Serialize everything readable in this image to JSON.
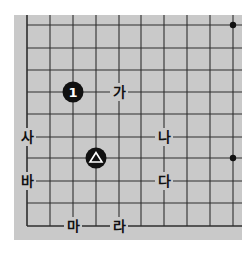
{
  "diagram": {
    "type": "go-board-fragment",
    "colors": {
      "page_bg": "#ffffff",
      "board_bg": "#c9c9c9",
      "line": "#2e2e2e",
      "stone_black": "#111111",
      "stone_mark": "#ffffff",
      "label_text": "#111111"
    },
    "board": {
      "x": 14,
      "y": 15,
      "width": 228,
      "height": 225
    },
    "grid": {
      "x_lines": [
        27,
        50,
        73,
        96,
        119,
        141,
        164,
        187,
        210,
        233
      ],
      "y_lines": [
        25,
        48,
        70,
        92,
        114,
        137,
        158,
        181,
        203,
        226
      ],
      "left_edge_drawn_from_row": 0,
      "bottom_edge_drawn": true
    },
    "star_points": [
      {
        "col": 9,
        "row": 0
      },
      {
        "col": 9,
        "row": 6
      }
    ],
    "stones": [
      {
        "id": "stone-1",
        "color": "black",
        "col": 2,
        "row": 3,
        "label": "1"
      },
      {
        "id": "stone-triangle",
        "color": "black",
        "col": 3,
        "row": 6,
        "mark": "triangle"
      }
    ],
    "labels": [
      {
        "id": "label-ga",
        "text": "가",
        "col": 4,
        "row": 3
      },
      {
        "id": "label-na",
        "text": "나",
        "col": 6,
        "row": 5
      },
      {
        "id": "label-da",
        "text": "다",
        "col": 6,
        "row": 7
      },
      {
        "id": "label-ra",
        "text": "라",
        "col": 4,
        "row": 9
      },
      {
        "id": "label-ma",
        "text": "마",
        "col": 2,
        "row": 9
      },
      {
        "id": "label-ba",
        "text": "바",
        "col": 0,
        "row": 7
      },
      {
        "id": "label-sa",
        "text": "사",
        "col": 0,
        "row": 5
      }
    ]
  }
}
